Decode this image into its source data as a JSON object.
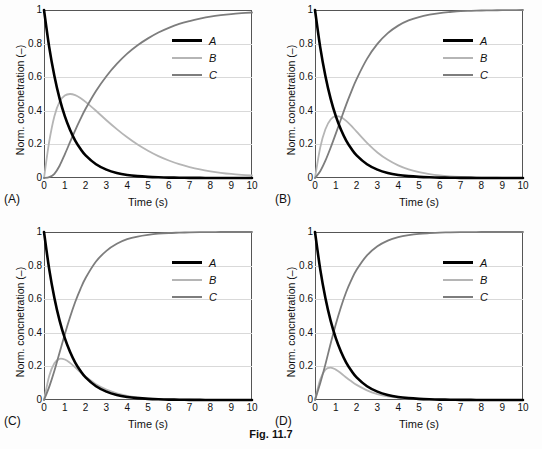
{
  "figure": {
    "caption": "Fig. 11.7"
  },
  "axes": {
    "xlabel": "Time (s)",
    "ylabel": "Norm. concnetration (–)",
    "xticks": [
      "0",
      "1",
      "2",
      "3",
      "4",
      "5",
      "6",
      "7",
      "8",
      "9",
      "10"
    ],
    "yticks": [
      "0",
      "0.2",
      "0.4",
      "0.6",
      "0.8",
      "1"
    ],
    "xlim": [
      0,
      10
    ],
    "ylim": [
      0,
      1
    ]
  },
  "legend": {
    "position": "top-right",
    "entries": [
      {
        "label": "A",
        "color": "#000000",
        "width": 3
      },
      {
        "label": "B",
        "color": "#b5b5b5",
        "width": 2
      },
      {
        "label": "C",
        "color": "#7d7d7d",
        "width": 2
      }
    ]
  },
  "panels": [
    {
      "id": "A",
      "label": "(A)"
    },
    {
      "id": "B",
      "label": "(B)"
    },
    {
      "id": "C",
      "label": "(C)"
    },
    {
      "id": "D",
      "label": "(D)"
    }
  ],
  "chart_data": [
    {
      "type": "line",
      "panel": "(A)",
      "title": "",
      "xlabel": "Time (s)",
      "ylabel": "Norm. concnetration (–)",
      "xlim": [
        0,
        10
      ],
      "ylim": [
        0,
        1
      ],
      "grid": true,
      "legend_position": "top-right",
      "x": [
        0,
        0.25,
        0.5,
        0.75,
        1,
        1.25,
        1.5,
        1.75,
        2,
        2.5,
        3,
        3.5,
        4,
        4.5,
        5,
        5.5,
        6,
        6.5,
        7,
        7.5,
        8,
        8.5,
        9,
        9.5,
        10
      ],
      "series": [
        {
          "name": "A",
          "color": "#000000",
          "values": [
            1,
            0.779,
            0.607,
            0.472,
            0.368,
            0.287,
            0.223,
            0.174,
            0.135,
            0.082,
            0.05,
            0.03,
            0.018,
            0.011,
            0.0067,
            0.0041,
            0.0025,
            0.0015,
            0.0009,
            0.00055,
            0.00034,
            0.0002,
            0.00012,
            8e-05,
            5e-05
          ]
        },
        {
          "name": "B",
          "color": "#b5b5b5",
          "values": [
            0,
            0.216,
            0.368,
            0.455,
            0.491,
            0.5,
            0.493,
            0.476,
            0.453,
            0.4,
            0.344,
            0.291,
            0.242,
            0.199,
            0.162,
            0.13,
            0.104,
            0.082,
            0.065,
            0.051,
            0.04,
            0.031,
            0.024,
            0.019,
            0.015
          ]
        },
        {
          "name": "C",
          "color": "#7d7d7d",
          "values": [
            0,
            0.005,
            0.025,
            0.073,
            0.141,
            0.213,
            0.284,
            0.35,
            0.412,
            0.518,
            0.606,
            0.679,
            0.74,
            0.79,
            0.831,
            0.866,
            0.894,
            0.917,
            0.934,
            0.948,
            0.96,
            0.969,
            0.976,
            0.981,
            0.985
          ]
        }
      ]
    },
    {
      "type": "line",
      "panel": "(B)",
      "title": "",
      "xlabel": "Time (s)",
      "ylabel": "Norm. concnetration (–)",
      "xlim": [
        0,
        10
      ],
      "ylim": [
        0,
        1
      ],
      "grid": true,
      "legend_position": "top-right",
      "x": [
        0,
        0.25,
        0.5,
        0.75,
        1,
        1.25,
        1.5,
        1.75,
        2,
        2.5,
        3,
        3.5,
        4,
        4.5,
        5,
        5.5,
        6,
        6.5,
        7,
        7.5,
        8,
        8.5,
        9,
        9.5,
        10
      ],
      "series": [
        {
          "name": "A",
          "color": "#000000",
          "values": [
            1,
            0.779,
            0.607,
            0.472,
            0.368,
            0.287,
            0.223,
            0.174,
            0.135,
            0.082,
            0.05,
            0.03,
            0.018,
            0.011,
            0.0067,
            0.0041,
            0.0025,
            0.0015,
            0.0009,
            0.00055,
            0.00034,
            0.0002,
            0.00012,
            8e-05,
            5e-05
          ]
        },
        {
          "name": "B",
          "color": "#b5b5b5",
          "values": [
            0,
            0.181,
            0.29,
            0.348,
            0.368,
            0.362,
            0.34,
            0.31,
            0.276,
            0.209,
            0.152,
            0.108,
            0.075,
            0.051,
            0.035,
            0.023,
            0.015,
            0.01,
            0.0066,
            0.0043,
            0.0028,
            0.0018,
            0.0012,
            0.0007,
            0.0005
          ]
        },
        {
          "name": "C",
          "color": "#7d7d7d",
          "values": [
            0,
            0.04,
            0.103,
            0.18,
            0.264,
            0.351,
            0.437,
            0.516,
            0.589,
            0.709,
            0.798,
            0.862,
            0.907,
            0.938,
            0.958,
            0.972,
            0.982,
            0.988,
            0.993,
            0.995,
            0.997,
            0.998,
            0.999,
            0.999,
            1.0
          ]
        }
      ]
    },
    {
      "type": "line",
      "panel": "(C)",
      "title": "",
      "xlabel": "Time (s)",
      "ylabel": "Norm. concnetration (–)",
      "xlim": [
        0,
        10
      ],
      "ylim": [
        0,
        1
      ],
      "grid": true,
      "legend_position": "top-right",
      "x": [
        0,
        0.25,
        0.5,
        0.75,
        1,
        1.25,
        1.5,
        1.75,
        2,
        2.5,
        3,
        3.5,
        4,
        4.5,
        5,
        5.5,
        6,
        6.5,
        7,
        7.5,
        8,
        8.5,
        9,
        9.5,
        10
      ],
      "series": [
        {
          "name": "A",
          "color": "#000000",
          "values": [
            1,
            0.779,
            0.607,
            0.472,
            0.368,
            0.287,
            0.223,
            0.174,
            0.135,
            0.082,
            0.05,
            0.03,
            0.018,
            0.011,
            0.0067,
            0.0041,
            0.0025,
            0.0015,
            0.0009,
            0.00055,
            0.00034,
            0.0002,
            0.00012,
            8e-05,
            5e-05
          ]
        },
        {
          "name": "B",
          "color": "#b5b5b5",
          "values": [
            0,
            0.143,
            0.219,
            0.245,
            0.241,
            0.221,
            0.194,
            0.166,
            0.139,
            0.094,
            0.062,
            0.04,
            0.025,
            0.016,
            0.01,
            0.0061,
            0.0038,
            0.0023,
            0.0014,
            0.0009,
            0.0005,
            0.0003,
            0.0002,
            0.0001,
            0.0001
          ]
        },
        {
          "name": "C",
          "color": "#7d7d7d",
          "values": [
            0,
            0.078,
            0.174,
            0.283,
            0.391,
            0.492,
            0.583,
            0.66,
            0.726,
            0.824,
            0.888,
            0.93,
            0.957,
            0.973,
            0.983,
            0.99,
            0.994,
            0.996,
            0.998,
            0.999,
            0.999,
            1.0,
            1.0,
            1.0,
            1.0
          ]
        }
      ]
    },
    {
      "type": "line",
      "panel": "(D)",
      "title": "",
      "xlabel": "Time (s)",
      "ylabel": "Norm. concnetration (–)",
      "xlim": [
        0,
        10
      ],
      "ylim": [
        0,
        1
      ],
      "grid": true,
      "legend_position": "top-right",
      "x": [
        0,
        0.25,
        0.5,
        0.75,
        1,
        1.25,
        1.5,
        1.75,
        2,
        2.5,
        3,
        3.5,
        4,
        4.5,
        5,
        5.5,
        6,
        6.5,
        7,
        7.5,
        8,
        8.5,
        9,
        9.5,
        10
      ],
      "series": [
        {
          "name": "A",
          "color": "#000000",
          "values": [
            1,
            0.779,
            0.607,
            0.472,
            0.368,
            0.287,
            0.223,
            0.174,
            0.135,
            0.082,
            0.05,
            0.03,
            0.018,
            0.011,
            0.0067,
            0.0041,
            0.0025,
            0.0015,
            0.0009,
            0.00055,
            0.00034,
            0.0002,
            0.00012,
            8e-05,
            5e-05
          ]
        },
        {
          "name": "B",
          "color": "#b5b5b5",
          "values": [
            0,
            0.122,
            0.181,
            0.193,
            0.181,
            0.159,
            0.134,
            0.111,
            0.09,
            0.057,
            0.035,
            0.021,
            0.013,
            0.0077,
            0.0046,
            0.0027,
            0.0016,
            0.001,
            0.0006,
            0.0003,
            0.0002,
            0.0001,
            0.0001,
            0.0,
            0.0
          ]
        },
        {
          "name": "C",
          "color": "#7d7d7d",
          "values": [
            0,
            0.099,
            0.212,
            0.335,
            0.451,
            0.554,
            0.643,
            0.715,
            0.775,
            0.861,
            0.915,
            0.949,
            0.969,
            0.981,
            0.989,
            0.993,
            0.996,
            0.998,
            0.999,
            0.999,
            1.0,
            1.0,
            1.0,
            1.0,
            1.0
          ]
        }
      ]
    }
  ]
}
